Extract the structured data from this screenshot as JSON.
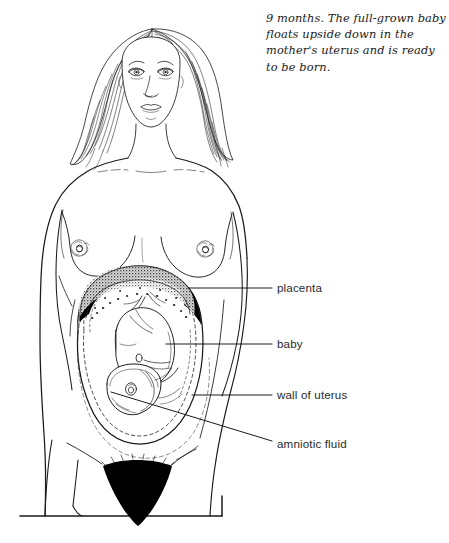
{
  "figure": {
    "type": "anatomical-illustration",
    "caption": "9 months. The full-grown baby floats upside down in the mother's uterus and is ready to be born.",
    "background_color": "#ffffff",
    "line_color": "#1a1a1a",
    "shade_color": "#000000"
  },
  "labels": {
    "placenta": "placenta",
    "baby": "baby",
    "wall_of_uterus": "wall of uterus",
    "amniotic_fluid": "amniotic fluid"
  },
  "label_leaders": {
    "placenta": {
      "x1": 188,
      "y1": 288,
      "x2": 272,
      "y2": 288
    },
    "baby": {
      "x1": 166,
      "y1": 344,
      "x2": 272,
      "y2": 344
    },
    "wall_of_uterus": {
      "x1": 192,
      "y1": 395,
      "x2": 272,
      "y2": 395
    },
    "amniotic_fluid": {
      "x1": 111,
      "y1": 392,
      "x2": 272,
      "y2": 441
    }
  },
  "anatomy_parts": [
    "head",
    "hair",
    "face",
    "neck",
    "collarbone",
    "shoulders",
    "breasts",
    "arms",
    "abdomen",
    "uterus-wall",
    "amniotic-sac",
    "placenta",
    "umbilical-cord",
    "fetus",
    "pubic-hair",
    "legs",
    "ground-line"
  ]
}
